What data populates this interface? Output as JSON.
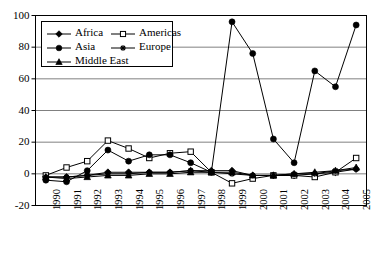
{
  "chart_data": {
    "type": "line",
    "title": "",
    "subtitle": "",
    "xlabel": "",
    "ylabel": "",
    "grid": "horizontal",
    "legend_position": "top-left-inside",
    "ylim": [
      -20,
      100
    ],
    "yticks": [
      100,
      80,
      60,
      40,
      20,
      0,
      -20
    ],
    "ytick_labels": [
      "100",
      "80",
      "60",
      "40",
      "20",
      "0",
      "-20"
    ],
    "x": [
      1990,
      1991,
      1992,
      1993,
      1994,
      1995,
      1996,
      1997,
      1998,
      1999,
      2000,
      2001,
      2002,
      2003,
      2004,
      2005
    ],
    "categories": [
      "1990",
      "1991",
      "1992",
      "1993",
      "1994",
      "1995",
      "1996",
      "1997",
      "1998",
      "1999",
      "2000",
      "2001",
      "2002",
      "2003",
      "2004",
      "2005"
    ],
    "series": [
      {
        "name": "Africa",
        "marker": "filled-diamond",
        "color": "#000000",
        "values": [
          -2,
          -2,
          -1,
          1,
          1,
          1,
          1,
          2,
          2,
          2,
          -1,
          -1,
          -1,
          0,
          1,
          3
        ]
      },
      {
        "name": "Americas",
        "marker": "open-square",
        "color": "#000000",
        "values": [
          -1,
          4,
          8,
          21,
          16,
          10,
          13,
          14,
          1,
          -6,
          -3,
          -1,
          -1,
          -2,
          1,
          10
        ]
      },
      {
        "name": "Asia",
        "marker": "filled-circle",
        "color": "#000000",
        "values": [
          -4,
          -5,
          2,
          15,
          8,
          12,
          12,
          7,
          1,
          96,
          76,
          22,
          7,
          65,
          55,
          94
        ]
      },
      {
        "name": "Europe",
        "marker": "asterisk",
        "color": "#000000",
        "values": [
          -2,
          -2,
          -1,
          0,
          0,
          1,
          1,
          2,
          1,
          0,
          -1,
          -1,
          0,
          0,
          2,
          3
        ]
      },
      {
        "name": "Middle East",
        "marker": "filled-triangle",
        "color": "#000000",
        "values": [
          -2,
          -3,
          -2,
          -1,
          -1,
          0,
          0,
          1,
          1,
          1,
          -1,
          -1,
          0,
          1,
          2,
          4
        ]
      }
    ]
  },
  "legend": {
    "entries": [
      {
        "label": "Africa",
        "marker": "filled-diamond"
      },
      {
        "label": "Americas",
        "marker": "open-square"
      },
      {
        "label": "Asia",
        "marker": "filled-circle"
      },
      {
        "label": "Europe",
        "marker": "asterisk"
      },
      {
        "label": "Middle East",
        "marker": "filled-triangle"
      }
    ]
  },
  "style": {
    "axis_color": "#000000",
    "grid_color": "#808080",
    "background": "#ffffff",
    "series_color": "#000000"
  }
}
